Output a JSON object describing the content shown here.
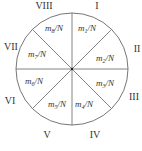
{
  "diagram": {
    "type": "sector-circle",
    "center": {
      "x": 72,
      "y": 69
    },
    "radius": 56,
    "stroke_color": "#666666",
    "sectors": [
      {
        "numeral": "I",
        "label_base": "m",
        "label_sub": "1",
        "label_tail": "/N"
      },
      {
        "numeral": "II",
        "label_base": "m",
        "label_sub": "2",
        "label_tail": "/N"
      },
      {
        "numeral": "III",
        "label_base": "m",
        "label_sub": "3",
        "label_tail": "/N"
      },
      {
        "numeral": "IV",
        "label_base": "m",
        "label_sub": "4",
        "label_tail": "/N"
      },
      {
        "numeral": "V",
        "label_base": "m",
        "label_sub": "5",
        "label_tail": "/N"
      },
      {
        "numeral": "VI",
        "label_base": "m",
        "label_sub": "6",
        "label_tail": "/N"
      },
      {
        "numeral": "VII",
        "label_base": "m",
        "label_sub": "7",
        "label_tail": "/N"
      },
      {
        "numeral": "VIII",
        "label_base": "m",
        "label_sub": "8",
        "label_tail": "/N"
      }
    ]
  }
}
